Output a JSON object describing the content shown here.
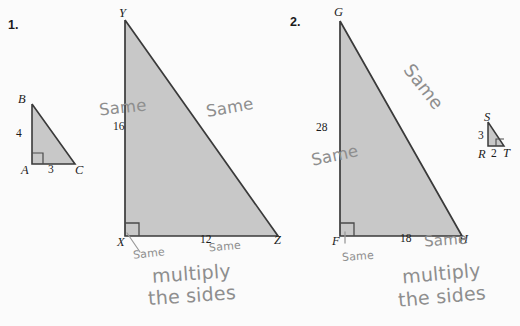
{
  "page": {
    "background_color": "#fbfbfb",
    "triangle_fill": "#c8c8c8",
    "triangle_stroke": "#3a3a3a",
    "pencil_color": "#8e8e8e"
  },
  "problems": [
    {
      "number": "1.",
      "small_triangle": {
        "vertices": {
          "top": "B",
          "bottom_left": "A",
          "bottom_right": "C"
        },
        "leg_vertical": "4",
        "leg_horizontal": "3",
        "right_angle_at": "A"
      },
      "large_triangle": {
        "vertices": {
          "top": "Y",
          "bottom_left": "X",
          "bottom_right": "Z"
        },
        "leg_vertical": "16",
        "leg_horizontal": "12",
        "right_angle_at": "X"
      },
      "annotations": {
        "left_leg": "Same",
        "hypotenuse": "Same",
        "bottom_left": "Same",
        "bottom_right": "Same",
        "note_line1": "multiply",
        "note_line2": "the sides"
      }
    },
    {
      "number": "2.",
      "small_triangle": {
        "vertices": {
          "top": "S",
          "bottom_left": "R",
          "bottom_right": "T"
        },
        "leg_vertical": "3",
        "leg_horizontal": "2",
        "right_angle_at": "T"
      },
      "large_triangle": {
        "vertices": {
          "top": "G",
          "bottom_left": "F",
          "bottom_right": "H"
        },
        "leg_vertical": "28",
        "leg_horizontal": "18",
        "right_angle_at": "F"
      },
      "annotations": {
        "left_leg": "Same",
        "hypotenuse": "Same",
        "bottom_left": "Same",
        "bottom_right": "Same",
        "note_line1": "multiply",
        "note_line2": "the sides"
      }
    }
  ]
}
